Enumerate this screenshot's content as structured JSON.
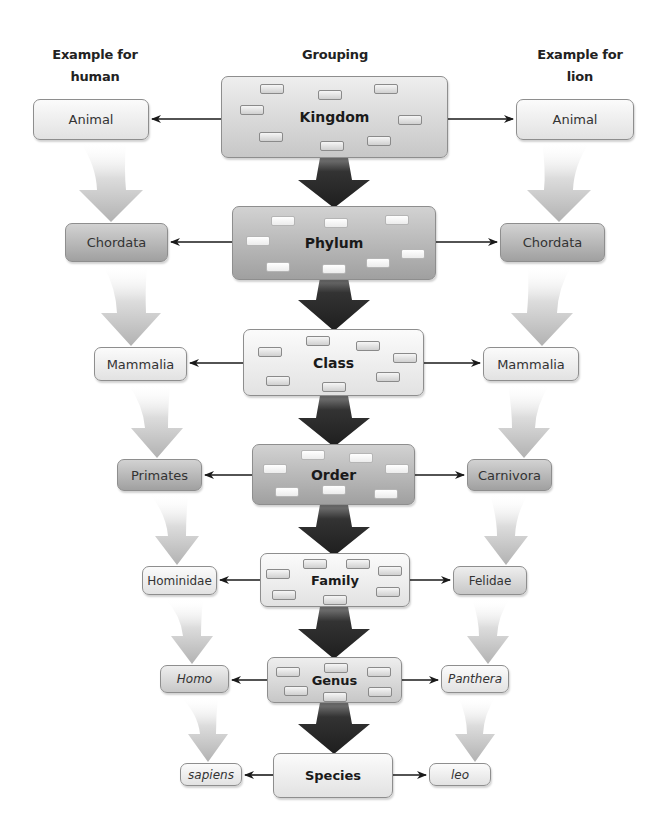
{
  "headers": {
    "left": "Example for human",
    "left_line1": "Example for",
    "left_line2": "human",
    "center": "Grouping",
    "right": "Example for lion",
    "right_line1": "Example for",
    "right_line2": "lion"
  },
  "ranks": [
    {
      "grouping": "Kingdom",
      "human": "Animal",
      "lion": "Animal"
    },
    {
      "grouping": "Phylum",
      "human": "Chordata",
      "lion": "Chordata"
    },
    {
      "grouping": "Class",
      "human": "Mammalia",
      "lion": "Mammalia"
    },
    {
      "grouping": "Order",
      "human": "Primates",
      "lion": "Carnivora"
    },
    {
      "grouping": "Family",
      "human": "Hominidae",
      "lion": "Felidae"
    },
    {
      "grouping": "Genus",
      "human": "Homo",
      "lion": "Panthera"
    },
    {
      "grouping": "Species",
      "human": "sapiens",
      "lion": "leo"
    }
  ],
  "colors": {
    "arrow_dark": "#2a2a2a",
    "arrow_light": "#bdbdbd",
    "box_border": "#8e8e8e"
  }
}
